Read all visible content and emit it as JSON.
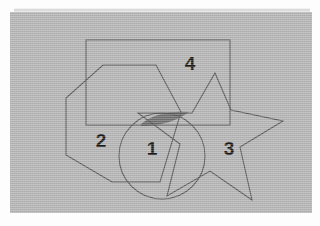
{
  "figure": {
    "canvas": {
      "width": 320,
      "height": 226
    },
    "background_color": "#fdfdfd",
    "panel": {
      "name": "gray-backdrop-panel",
      "x": 10,
      "y": 12,
      "width": 302,
      "height": 201,
      "fill_color": "#b4b4b4",
      "texture": "scanned-paper-grain"
    },
    "stroke_color": "#575757",
    "label_color": "#1a1a1a",
    "shaded_region": {
      "name": "dark-overlap-lens",
      "fill_color": "#6e6e6e",
      "description": "thin crescent where the circle arc, star arm and rectangle edge overlap",
      "path": "M 141,124 Q 158,110 189,112 Q 170,126 141,126 Z"
    },
    "shapes": [
      {
        "id": "shape-1",
        "label": "1",
        "kind": "circle",
        "cx": 162,
        "cy": 156,
        "r": 43,
        "label_x": 152,
        "label_y": 148
      },
      {
        "id": "shape-2",
        "label": "2",
        "kind": "heptagon",
        "points": "103,65 156,65 181,112 160,182 112,182 66,155 66,98",
        "label_x": 101,
        "label_y": 140
      },
      {
        "id": "shape-3",
        "label": "3",
        "kind": "five-pointed-star",
        "points": "215,73 231,110 283,121 240,147 252,200 210,171 167,196 180,144 138,113 192,113",
        "label_x": 229,
        "label_y": 148
      },
      {
        "id": "shape-4",
        "label": "4",
        "kind": "rectangle",
        "x": 86,
        "y": 40,
        "width": 144,
        "height": 85,
        "label_x": 190,
        "label_y": 63
      }
    ]
  }
}
